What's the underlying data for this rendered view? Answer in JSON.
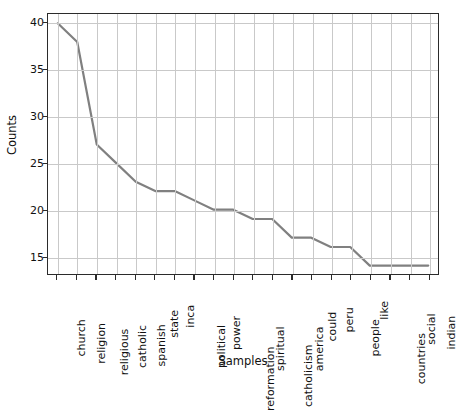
{
  "chart_data": {
    "type": "line",
    "title": "",
    "xlabel": "Samples",
    "ylabel": "Counts",
    "categories": [
      "church",
      "religion",
      "religious",
      "catholic",
      "spanish",
      "state",
      "inca",
      "political",
      "power",
      "reformation",
      "spiritual",
      "catholicism",
      "america",
      "could",
      "peru",
      "people",
      "like",
      "countries",
      "social",
      "indian"
    ],
    "values": [
      40,
      38,
      27,
      25,
      23,
      22,
      22,
      21,
      20,
      20,
      19,
      19,
      17,
      17,
      16,
      16,
      14,
      14,
      14,
      14
    ],
    "series": [
      {
        "name": "Counts",
        "values": [
          40,
          38,
          27,
          25,
          23,
          22,
          22,
          21,
          20,
          20,
          19,
          19,
          17,
          17,
          16,
          16,
          14,
          14,
          14,
          14
        ],
        "color": "#808080"
      }
    ],
    "ylim": [
      13.1,
      41.0
    ],
    "yticks": [
      15,
      20,
      25,
      30,
      35,
      40
    ],
    "ytick_labels": [
      "15",
      "20",
      "25",
      "30",
      "35",
      "40"
    ],
    "grid": true,
    "legend": false,
    "line_color": "#808080",
    "line_width": 2.2,
    "axes_color": "#2b2b2b",
    "grid_color": "#c9c9c9",
    "background": "#ffffff"
  }
}
